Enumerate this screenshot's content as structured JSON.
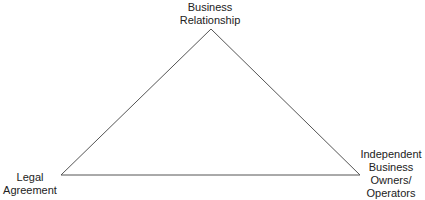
{
  "diagram": {
    "type": "triangle",
    "line_color": "#555555",
    "vertices": {
      "top": {
        "x": 211,
        "y": 29,
        "label_lines": [
          "Business",
          "Relationship"
        ]
      },
      "left": {
        "x": 61,
        "y": 175,
        "label_lines": [
          "Legal",
          "Agreement"
        ]
      },
      "right": {
        "x": 360,
        "y": 175,
        "label_lines": [
          "Independent",
          "Business",
          "Owners/",
          "Operators"
        ]
      }
    }
  }
}
